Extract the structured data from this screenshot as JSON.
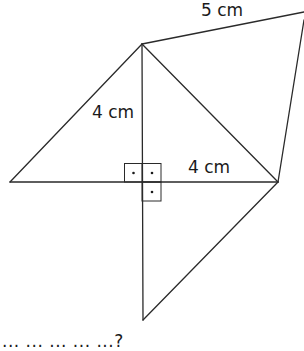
{
  "figure": {
    "labels": {
      "top_edge": "5 cm",
      "vertical_segment": "4 cm",
      "horizontal_segment": "4 cm"
    },
    "right_angle_markers": 3,
    "caption_cut_off": "... ... ... ... ...?",
    "points": {
      "T": [
        142,
        44
      ],
      "R5": [
        304,
        12
      ],
      "R": [
        278,
        182
      ],
      "L": [
        10,
        182
      ],
      "C": [
        142,
        182
      ],
      "B": [
        143,
        320
      ]
    },
    "colors": {
      "line": "#2a2a2a",
      "background": "#ffffff",
      "text": "#1a1a1a"
    }
  }
}
